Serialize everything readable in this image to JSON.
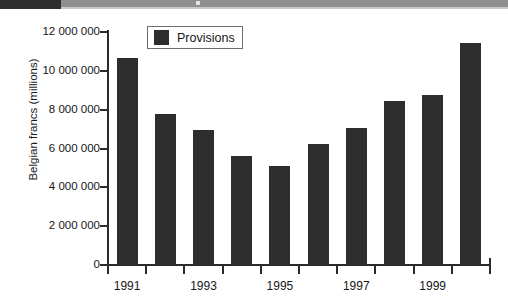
{
  "decor": {
    "top_band_dark_color": "#2e2e2e",
    "top_band_light_color": "#8f8f8f"
  },
  "legend": {
    "position": "top-left-inside",
    "entries": [
      {
        "label": "Provisions",
        "color": "#2d2d2d",
        "swatch": "filled-square-swatch"
      }
    ]
  },
  "chart_data": {
    "type": "bar",
    "title": "",
    "subtitle": "",
    "xlabel": "",
    "ylabel": "Belgian francs (millions)",
    "categories": [
      "1991",
      "1992",
      "1993",
      "1994",
      "1995",
      "1996",
      "1997",
      "1998",
      "1999",
      "2000"
    ],
    "visible_tick_labels": [
      "1991",
      "1993",
      "1995",
      "1997",
      "1999"
    ],
    "series": [
      {
        "name": "Provisions",
        "color": "#2d2d2d",
        "values": [
          10670000,
          7780000,
          6950000,
          5600000,
          5100000,
          6250000,
          7050000,
          8450000,
          8770000,
          11450000
        ]
      }
    ],
    "ylim": [
      0,
      12000000
    ],
    "ytick_values": [
      0,
      2000000,
      4000000,
      6000000,
      8000000,
      10000000,
      12000000
    ],
    "ytick_labels": [
      "0",
      "2 000 000",
      "4 000 000",
      "6 000 000",
      "8 000 000",
      "10 000 000",
      "12 000 000"
    ],
    "grid": false,
    "legend_position": "upper left inside axes"
  }
}
